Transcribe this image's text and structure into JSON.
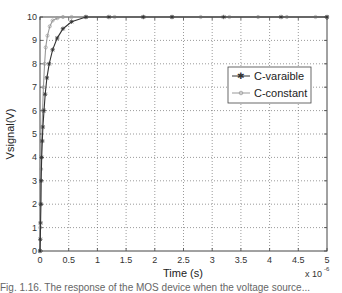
{
  "chart_data": {
    "type": "line",
    "title": "",
    "xlabel": "Time (s)",
    "ylabel": "Vsignal(V)",
    "x_multiplier": "x 10^-6",
    "xlim": [
      0,
      5
    ],
    "ylim": [
      0,
      10
    ],
    "xticks": [
      "0",
      "0.5",
      "1",
      "1.5",
      "2",
      "2.5",
      "3",
      "3.5",
      "4",
      "4.5",
      "5"
    ],
    "yticks": [
      "0",
      "1",
      "2",
      "3",
      "4",
      "5",
      "6",
      "7",
      "8",
      "9",
      "10"
    ],
    "grid": true,
    "legend_position": "upper right (inside)",
    "series": [
      {
        "name": "C-varaible",
        "color": "#333333",
        "marker": "star",
        "x": [
          0,
          0.005,
          0.01,
          0.015,
          0.02,
          0.03,
          0.04,
          0.05,
          0.07,
          0.09,
          0.12,
          0.16,
          0.22,
          0.3,
          0.4,
          0.55,
          0.8,
          1.2,
          1.8,
          2.3,
          3.2,
          4.2,
          5.0
        ],
        "y": [
          0,
          0.5,
          1.2,
          2.0,
          3.0,
          4.0,
          4.7,
          5.3,
          6.0,
          6.7,
          7.4,
          8.0,
          8.6,
          9.1,
          9.5,
          9.8,
          10,
          10,
          10,
          10,
          10,
          10,
          10
        ]
      },
      {
        "name": "C-constant",
        "color": "#999999",
        "marker": "circle",
        "x": [
          0,
          0.005,
          0.01,
          0.02,
          0.03,
          0.045,
          0.06,
          0.08,
          0.1,
          0.13,
          0.17,
          0.22,
          0.3,
          0.4,
          0.55,
          0.8,
          1.3,
          1.8,
          2.3,
          2.8,
          3.3,
          3.8,
          4.3,
          4.8,
          5.0
        ],
        "y": [
          0,
          1.0,
          2.0,
          3.5,
          4.7,
          6.0,
          7.0,
          8.0,
          8.7,
          9.2,
          9.6,
          9.85,
          9.95,
          10,
          10,
          10,
          10,
          10,
          10,
          10,
          10,
          10,
          10,
          10,
          10
        ]
      }
    ]
  },
  "caption": "Fig. 1.16. The response of the MOS device when the voltage source..."
}
